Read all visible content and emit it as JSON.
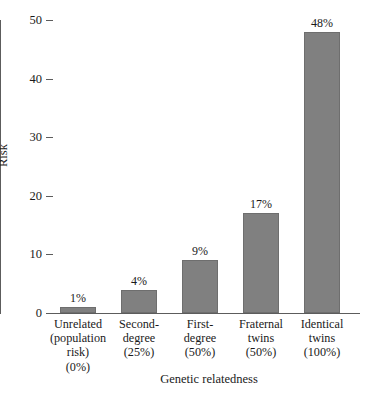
{
  "chart_data": {
    "type": "bar",
    "title": "",
    "xlabel": "Genetic relatedness",
    "ylabel": "Risk",
    "categories": [
      "Unrelated\n(population\nrisk)\n(0%)",
      "Second-\ndegree\n(25%)",
      "First-\ndegree\n(50%)",
      "Fraternal\ntwins\n(50%)",
      "Identical\ntwins\n(100%)"
    ],
    "values": [
      1,
      4,
      9,
      17,
      48
    ],
    "data_labels": [
      "1%",
      "4%",
      "9%",
      "17%",
      "48%"
    ],
    "ylim": [
      0,
      50
    ],
    "yticks": [
      0,
      10,
      20,
      30,
      40,
      50
    ],
    "ytick_labels": [
      "0",
      "10",
      "20",
      "30",
      "40",
      "50"
    ],
    "grid": false,
    "legend": false,
    "bar_color": "#808080",
    "bar_edge_color": "#6e6e6e",
    "axis_color": "#5c5c5c",
    "background": "#ffffff"
  }
}
